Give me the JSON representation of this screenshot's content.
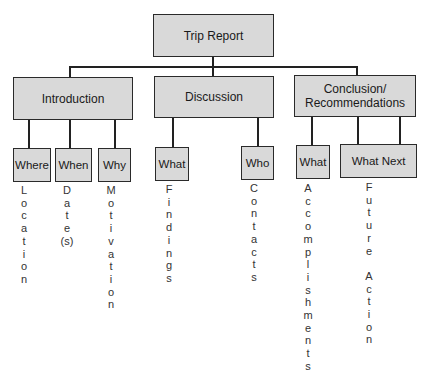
{
  "diagram": {
    "root": {
      "label": "Trip Report"
    },
    "sections": [
      {
        "label": "Introduction",
        "children": [
          {
            "label": "Where",
            "detail": "Location"
          },
          {
            "label": "When",
            "detail": "Date(s)"
          },
          {
            "label": "Why",
            "detail": "Motivation"
          }
        ]
      },
      {
        "label": "Discussion",
        "children": [
          {
            "label": "What",
            "detail": "Findings"
          },
          {
            "label": "Who",
            "detail": "Contacts"
          }
        ]
      },
      {
        "label": "Conclusion/ Recommendations",
        "children": [
          {
            "label": "What",
            "detail": "Accomplishments"
          },
          {
            "label": "What Next",
            "detail": "Future Action"
          }
        ]
      }
    ],
    "colors": {
      "box_fill": "#d9d9d9",
      "border": "#2a2a2a",
      "connector": "#222222"
    }
  }
}
